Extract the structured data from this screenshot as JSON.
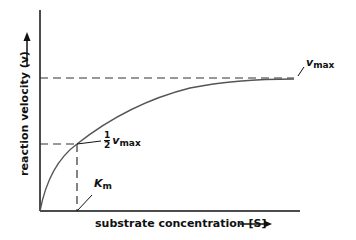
{
  "diagram": {
    "y_axis_label": "reaction velocity (v)",
    "x_axis_label": "substrate concentration [S]",
    "vmax_label": {
      "symbol": "v",
      "subscript": "max"
    },
    "half_vmax_label": {
      "numerator": "1",
      "denominator": "2",
      "symbol": "v",
      "subscript": "max"
    },
    "km_label": {
      "symbol": "K",
      "subscript": "m"
    },
    "colors": {
      "axis": "#111111",
      "curve": "#555555",
      "dashed": "#333333"
    }
  }
}
